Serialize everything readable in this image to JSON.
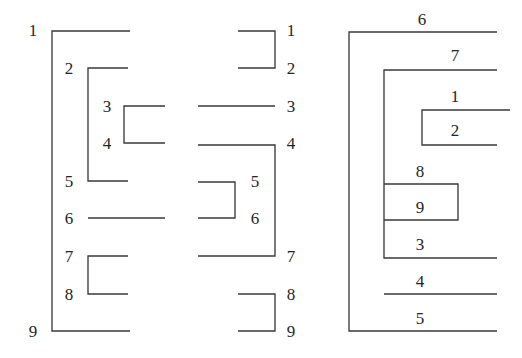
{
  "figure": {
    "background_color": "#ffffff",
    "stroke_color": "#3a3a3a",
    "label_color": "#262626",
    "panel_count": 3
  },
  "panels": [
    {
      "name": "left-panel",
      "side": "left",
      "labels": [
        {
          "text": "1",
          "x": 33,
          "y": 30
        },
        {
          "text": "2",
          "x": 69,
          "y": 68
        },
        {
          "text": "3",
          "x": 107,
          "y": 106
        },
        {
          "text": "4",
          "x": 107,
          "y": 143
        },
        {
          "text": "5",
          "x": 69,
          "y": 181
        },
        {
          "text": "6",
          "x": 69,
          "y": 218
        },
        {
          "text": "7",
          "x": 69,
          "y": 256
        },
        {
          "text": "8",
          "x": 69,
          "y": 294
        },
        {
          "text": "9",
          "x": 33,
          "y": 331
        }
      ],
      "paths": [
        {
          "name": "arc-1-9",
          "d": "M 130 31 L 52 31 L 52 331 L 130 331"
        },
        {
          "name": "arc-2-5",
          "d": "M 128 68 L 88 68 L 88 181 L 128 181"
        },
        {
          "name": "arc-3-4",
          "d": "M 165 106 L 124 106 L 124 143 L 165 143"
        },
        {
          "name": "arc-6",
          "d": "M 88 218 L 165 218"
        },
        {
          "name": "arc-7-8",
          "d": "M 128 256 L 88 256 L 88 294 L 128 294"
        }
      ]
    },
    {
      "name": "middle-panel",
      "side": "middle",
      "labels": [
        {
          "text": "1",
          "x": 291,
          "y": 30
        },
        {
          "text": "2",
          "x": 291,
          "y": 68
        },
        {
          "text": "3",
          "x": 291,
          "y": 106
        },
        {
          "text": "4",
          "x": 291,
          "y": 143
        },
        {
          "text": "5",
          "x": 255,
          "y": 181
        },
        {
          "text": "6",
          "x": 255,
          "y": 218
        },
        {
          "text": "7",
          "x": 291,
          "y": 256
        },
        {
          "text": "8",
          "x": 291,
          "y": 294
        },
        {
          "text": "9",
          "x": 291,
          "y": 331
        }
      ],
      "paths": [
        {
          "name": "arc-1-2",
          "d": "M 238 31 L 275 31 L 275 68 L 238 68"
        },
        {
          "name": "arc-3",
          "d": "M 198 106 L 275 106"
        },
        {
          "name": "arc-4-7",
          "d": "M 198 145 L 275 145 L 275 256 L 198 256"
        },
        {
          "name": "arc-5-6",
          "d": "M 198 182 L 235 182 L 235 218 L 198 218"
        },
        {
          "name": "arc-8-9",
          "d": "M 238 294 L 275 294 L 275 331 L 238 331"
        }
      ]
    },
    {
      "name": "right-panel",
      "side": "right",
      "labels": [
        {
          "text": "6",
          "x": 422,
          "y": 19
        },
        {
          "text": "7",
          "x": 455,
          "y": 55
        },
        {
          "text": "1",
          "x": 455,
          "y": 96
        },
        {
          "text": "2",
          "x": 455,
          "y": 130
        },
        {
          "text": "8",
          "x": 420,
          "y": 171
        },
        {
          "text": "9",
          "x": 420,
          "y": 207
        },
        {
          "text": "3",
          "x": 420,
          "y": 244
        },
        {
          "text": "4",
          "x": 420,
          "y": 281
        },
        {
          "text": "5",
          "x": 420,
          "y": 318
        }
      ],
      "paths": [
        {
          "name": "arc-6-5",
          "d": "M 497 32 L 349 32 L 349 331 L 497 331"
        },
        {
          "name": "arc-7-3",
          "d": "M 497 70 L 384 70 L 384 258 L 497 258"
        },
        {
          "name": "arc-1-2",
          "d": "M 510 110 L 422 110 L 422 145 L 497 145"
        },
        {
          "name": "arc-8-9",
          "d": "M 384 184 L 458 184 L 458 220 L 384 220"
        },
        {
          "name": "arc-4",
          "d": "M 384 294 L 497 294"
        }
      ]
    }
  ]
}
